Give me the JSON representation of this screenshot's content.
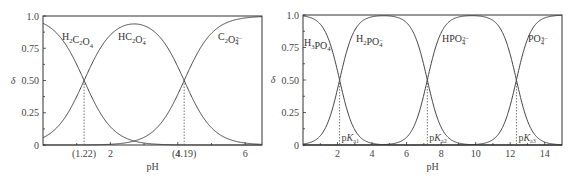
{
  "chart_data": [
    {
      "type": "line",
      "title": "",
      "xlabel": "pH",
      "ylabel": "δ",
      "xlim": [
        0,
        6.5
      ],
      "ylim": [
        0,
        1.0
      ],
      "grid": false,
      "legend": "inline labels",
      "xticks": [
        2,
        4,
        6
      ],
      "yticks": [
        "0",
        "0.25",
        "0.50",
        "0.75",
        "1.0"
      ],
      "pKa": [
        1.22,
        4.19
      ],
      "marker_labels": [
        "(1.22)",
        "(4.19)"
      ],
      "series": [
        {
          "name": "H2C2O4",
          "label_main": "H",
          "label_parts": [
            "H",
            "2",
            "C",
            "2",
            "O",
            "4",
            "",
            ""
          ],
          "x": [
            0,
            1,
            1.22,
            2,
            3,
            4.19,
            5,
            6.5
          ],
          "values": [
            0.94,
            0.62,
            0.5,
            0.14,
            0.02,
            0.0,
            0.0,
            0.0
          ]
        },
        {
          "name": "HC2O4-",
          "x": [
            0,
            1,
            1.22,
            2,
            2.7,
            3,
            4.19,
            5,
            6.5
          ],
          "values": [
            0.06,
            0.38,
            0.5,
            0.84,
            0.93,
            0.92,
            0.5,
            0.13,
            0.0
          ]
        },
        {
          "name": "C2O4 2-",
          "x": [
            0,
            2,
            2.7,
            3,
            4.19,
            5,
            6.5
          ],
          "values": [
            0.0,
            0.02,
            0.03,
            0.06,
            0.5,
            0.87,
            1.0
          ]
        }
      ]
    },
    {
      "type": "line",
      "title": "",
      "xlabel": "pH",
      "ylabel": "δ",
      "xlim": [
        0,
        15
      ],
      "ylim": [
        0,
        1.0
      ],
      "grid": false,
      "legend": "inline labels",
      "xticks": [
        2,
        4,
        6,
        8,
        10,
        12,
        14
      ],
      "yticks": [
        "0",
        "0.25",
        "0.50",
        "0.75",
        "1.0"
      ],
      "pKa": [
        2.12,
        7.2,
        12.36
      ],
      "marker_labels": [
        "pKa1",
        "pKa2",
        "pKa3"
      ],
      "series": [
        {
          "name": "H3PO4",
          "x": [
            0,
            1,
            2.12,
            3,
            4,
            15
          ],
          "values": [
            0.99,
            0.93,
            0.5,
            0.12,
            0.01,
            0.0
          ]
        },
        {
          "name": "H2PO4-",
          "x": [
            0,
            1,
            2.12,
            3,
            4.7,
            6,
            7.2,
            8,
            9,
            15
          ],
          "values": [
            0.01,
            0.07,
            0.5,
            0.88,
            1.0,
            0.94,
            0.5,
            0.14,
            0.02,
            0.0
          ]
        },
        {
          "name": "HPO4 2-",
          "x": [
            0,
            6,
            7.2,
            8,
            9.8,
            11,
            12.36,
            13,
            14,
            15
          ],
          "values": [
            0.0,
            0.06,
            0.5,
            0.86,
            1.0,
            0.96,
            0.5,
            0.19,
            0.02,
            0.0
          ]
        },
        {
          "name": "PO4 3-",
          "x": [
            0,
            11,
            12.36,
            13,
            14,
            15
          ],
          "values": [
            0.0,
            0.04,
            0.5,
            0.81,
            0.98,
            1.0
          ]
        }
      ]
    }
  ],
  "left": {
    "frame": {
      "x0": 43,
      "x1": 262,
      "y0": 16,
      "y1": 145
    },
    "xmax": 6.5,
    "pKa": [
      1.22,
      4.19
    ],
    "ylabel": "δ",
    "xlabel": "pH",
    "yticks": [
      {
        "v": 0,
        "label": "0"
      },
      {
        "v": 0.25,
        "label": "0.25"
      },
      {
        "v": 0.5,
        "label": "0.50"
      },
      {
        "v": 0.75,
        "label": "0.75"
      },
      {
        "v": 1.0,
        "label": "1.0"
      }
    ],
    "xticks": [
      {
        "v": 2,
        "label": "2"
      },
      {
        "v": 4,
        "label": "4"
      },
      {
        "v": 6,
        "label": "6"
      }
    ],
    "marker_labels": [
      {
        "v": 1.22,
        "label": "(1.22)"
      },
      {
        "v": 4.19,
        "label": "(4.19)"
      }
    ],
    "species": [
      {
        "base": "H",
        "parts": [
          [
            "H",
            ""
          ],
          [
            "2",
            "sub"
          ],
          [
            "C",
            ""
          ],
          [
            "2",
            "sub"
          ],
          [
            "O",
            ""
          ],
          [
            "4",
            "sub"
          ]
        ],
        "x": 62,
        "y": 40
      },
      {
        "parts": [
          [
            "HC",
            ""
          ],
          [
            "2",
            "sub"
          ],
          [
            "O",
            ""
          ],
          [
            "4",
            "sub"
          ],
          [
            "−",
            "sup"
          ]
        ],
        "x": 118,
        "y": 40
      },
      {
        "parts": [
          [
            "C",
            ""
          ],
          [
            "2",
            "sub"
          ],
          [
            "O",
            ""
          ],
          [
            "4",
            "sub"
          ],
          [
            "2−",
            "sup"
          ]
        ],
        "x": 218,
        "y": 40
      }
    ]
  },
  "right": {
    "frame": {
      "x0": 303,
      "x1": 562,
      "y0": 15,
      "y1": 145
    },
    "xmax": 15,
    "pKa": [
      2.12,
      7.2,
      12.36
    ],
    "ylabel": "δ",
    "xlabel": "pH",
    "yticks": [
      {
        "v": 0,
        "label": "0"
      },
      {
        "v": 0.25,
        "label": "0.25"
      },
      {
        "v": 0.5,
        "label": "0.50"
      },
      {
        "v": 0.75,
        "label": "0.75"
      },
      {
        "v": 1.0,
        "label": "1.0"
      }
    ],
    "xticks": [
      {
        "v": 2,
        "label": "2"
      },
      {
        "v": 4,
        "label": "4"
      },
      {
        "v": 6,
        "label": "6"
      },
      {
        "v": 8,
        "label": "8"
      },
      {
        "v": 10,
        "label": "10"
      },
      {
        "v": 12,
        "label": "12"
      },
      {
        "v": 14,
        "label": "14"
      }
    ],
    "marker_labels": [
      {
        "v": 2.12,
        "sub": "a1"
      },
      {
        "v": 7.2,
        "sub": "a2"
      },
      {
        "v": 12.36,
        "sub": "a3"
      }
    ],
    "species": [
      {
        "parts": [
          [
            "H",
            ""
          ],
          [
            "3",
            "sub"
          ],
          [
            "PO",
            ""
          ],
          [
            "4",
            "sub"
          ]
        ],
        "x": 304,
        "y": 46
      },
      {
        "parts": [
          [
            "H",
            ""
          ],
          [
            "2",
            "sub"
          ],
          [
            "PO",
            ""
          ],
          [
            "4",
            "sub"
          ],
          [
            "−",
            "sup"
          ]
        ],
        "x": 356,
        "y": 42
      },
      {
        "parts": [
          [
            "HPO",
            ""
          ],
          [
            "4",
            "sub"
          ],
          [
            "2−",
            "sup"
          ]
        ],
        "x": 442,
        "y": 42
      },
      {
        "parts": [
          [
            "PO",
            ""
          ],
          [
            "4",
            "sub"
          ],
          [
            "3−",
            "sup"
          ]
        ],
        "x": 528,
        "y": 42
      }
    ]
  }
}
